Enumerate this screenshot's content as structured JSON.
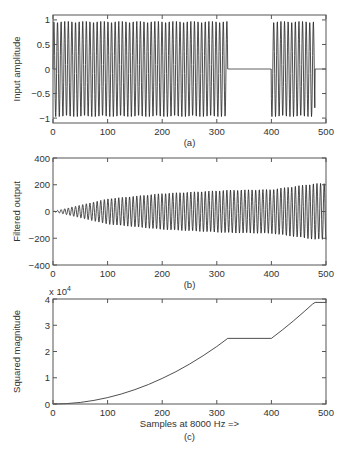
{
  "figure": {
    "width": 348,
    "height": 451,
    "line_color": "#222222",
    "axis_color": "#555555"
  },
  "chart_data": [
    {
      "id": "a",
      "type": "line",
      "title": "",
      "caption": "(a)",
      "xlabel": "",
      "ylabel": "Input amplitude",
      "xlim": [
        0,
        500
      ],
      "ylim": [
        -1.1,
        1.1
      ],
      "xticks": [
        0,
        100,
        200,
        300,
        400,
        500
      ],
      "xtick_labels": [
        "0",
        "100",
        "200",
        "300",
        "400",
        "500"
      ],
      "yticks": [
        -1,
        -0.5,
        0,
        0.5,
        1
      ],
      "ytick_labels": [
        "−1",
        "−0.5",
        "0",
        "0.5",
        "1"
      ],
      "exponent_label": "",
      "grid": false,
      "signal": {
        "kind": "gated_sinusoid",
        "amplitude": 1.0,
        "period_samples": 6.6,
        "on_segments": [
          [
            0,
            320
          ],
          [
            400,
            480
          ]
        ],
        "off_value": 0
      },
      "box": {
        "left": 53,
        "top": 15,
        "right": 326,
        "bottom": 123
      }
    },
    {
      "id": "b",
      "type": "line",
      "title": "",
      "caption": "(b)",
      "xlabel": "",
      "ylabel": "Filtered output",
      "xlim": [
        0,
        500
      ],
      "ylim": [
        -400,
        400
      ],
      "xticks": [
        0,
        100,
        200,
        300,
        400,
        500
      ],
      "xtick_labels": [
        "0",
        "100",
        "200",
        "300",
        "400",
        "500"
      ],
      "yticks": [
        -400,
        -200,
        0,
        200,
        400
      ],
      "ytick_labels": [
        "−400",
        "−200",
        "0",
        "200",
        "400"
      ],
      "exponent_label": "",
      "grid": false,
      "signal": {
        "kind": "growing_sinusoid",
        "period_samples": 6.6,
        "envelope": [
          [
            0,
            0
          ],
          [
            100,
            95
          ],
          [
            200,
            135
          ],
          [
            320,
            160
          ],
          [
            400,
            165
          ],
          [
            480,
            210
          ],
          [
            500,
            210
          ]
        ]
      },
      "box": {
        "left": 53,
        "top": 158,
        "right": 326,
        "bottom": 265
      }
    },
    {
      "id": "c",
      "type": "line",
      "title": "",
      "caption": "(c)",
      "xlabel": "Samples at 8000 Hz =>",
      "ylabel": "Squared magnitude",
      "xlim": [
        0,
        500
      ],
      "ylim": [
        0,
        40000
      ],
      "xticks": [
        0,
        100,
        200,
        300,
        400,
        500
      ],
      "xtick_labels": [
        "0",
        "100",
        "200",
        "300",
        "400",
        "500"
      ],
      "yticks": [
        0,
        10000,
        20000,
        30000,
        40000
      ],
      "ytick_labels": [
        "0",
        "1",
        "2",
        "3",
        "4"
      ],
      "exponent_label": "x 10",
      "exponent_power": "4",
      "grid": false,
      "points": {
        "x": [
          0,
          25,
          50,
          75,
          100,
          125,
          150,
          175,
          200,
          225,
          250,
          275,
          300,
          320,
          400,
          420,
          440,
          460,
          475,
          480,
          500
        ],
        "y": [
          0,
          150,
          600,
          1370,
          2440,
          3800,
          5480,
          7450,
          9750,
          12300,
          15200,
          18400,
          21900,
          25000,
          25000,
          28200,
          31600,
          35200,
          38000,
          38700,
          38700
        ]
      },
      "box": {
        "left": 53,
        "top": 299,
        "right": 326,
        "bottom": 404
      }
    }
  ]
}
